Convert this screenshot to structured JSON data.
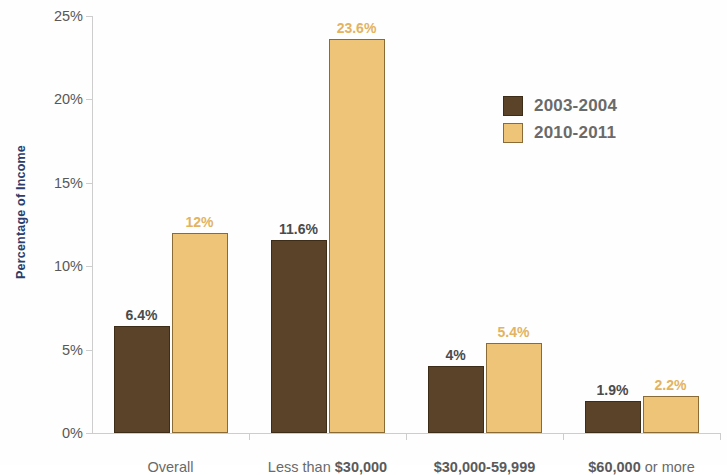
{
  "chart_data": {
    "type": "bar",
    "title": "",
    "xlabel": "",
    "ylabel": "Percentage of Income",
    "categories": [
      "Overall",
      "Less than $30,000",
      "$30,000-59,999",
      "$60,000 or more"
    ],
    "series": [
      {
        "name": "2003-2004",
        "color": "#5b432a",
        "values": [
          6.4,
          11.6,
          4,
          1.9
        ],
        "labels": [
          "6.4%",
          "11.6%",
          "4%",
          "1.9%"
        ]
      },
      {
        "name": "2010-2011",
        "color": "#eec479",
        "values": [
          12,
          23.6,
          5.4,
          2.2
        ],
        "labels": [
          "12%",
          "23.6%",
          "5.4%",
          "2.2%"
        ]
      }
    ],
    "ylim": [
      0,
      25
    ],
    "yticks": [
      0,
      5,
      10,
      15,
      20,
      25
    ],
    "ytick_labels": [
      "0%",
      "5%",
      "10%",
      "15%",
      "20%",
      "25%"
    ],
    "grid": false,
    "legend_position": "upper right",
    "category_label_parts": [
      [
        {
          "text": "Overall",
          "bold": false
        }
      ],
      [
        {
          "text": "Less than ",
          "bold": false
        },
        {
          "text": "$30,000",
          "bold": true
        }
      ],
      [
        {
          "text": "$30,000-59,999",
          "bold": true
        }
      ],
      [
        {
          "text": "$60,000",
          "bold": true
        },
        {
          "text": " or more",
          "bold": false
        }
      ]
    ]
  }
}
